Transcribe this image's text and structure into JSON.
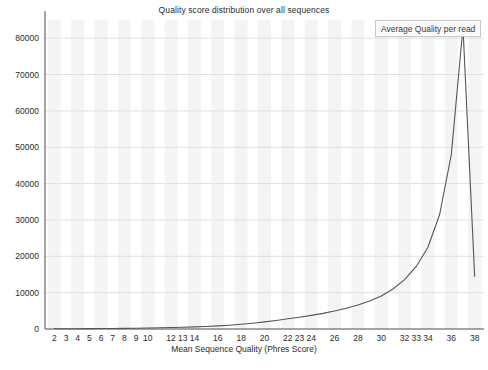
{
  "chart_data": {
    "type": "line",
    "title": "Quality score distribution over all sequences",
    "xlabel": "Mean Sequence Quality (Phres Score)",
    "ylabel": "",
    "xlim": [
      1.2,
      38.8
    ],
    "ylim": [
      0,
      85000
    ],
    "grid": true,
    "legend_position": "top-right",
    "series": [
      {
        "name": "Average Quality per read",
        "color": "#555555",
        "x": [
          2,
          3,
          4,
          5,
          6,
          7,
          8,
          9,
          10,
          11,
          12,
          13,
          14,
          15,
          16,
          17,
          18,
          19,
          20,
          21,
          22,
          23,
          24,
          25,
          26,
          27,
          28,
          29,
          30,
          31,
          32,
          33,
          34,
          35,
          36,
          37,
          38
        ],
        "values": [
          60,
          70,
          85,
          100,
          120,
          150,
          180,
          220,
          270,
          330,
          400,
          480,
          580,
          700,
          850,
          1050,
          1300,
          1600,
          1950,
          2350,
          2800,
          3250,
          3750,
          4300,
          4950,
          5700,
          6600,
          7700,
          9100,
          11000,
          13600,
          17200,
          22500,
          31500,
          48000,
          83000,
          14500
        ]
      }
    ],
    "yticks": [
      0,
      10000,
      20000,
      30000,
      40000,
      50000,
      60000,
      70000,
      80000
    ],
    "ytick_labels": [
      "0",
      "10000",
      "20000",
      "30000",
      "40000",
      "50000",
      "60000",
      "70000",
      "80000"
    ],
    "xticks": [
      2,
      3,
      4,
      5,
      6,
      7,
      8,
      9,
      10,
      12,
      13,
      14,
      16,
      18,
      20,
      22,
      23,
      24,
      26,
      28,
      30,
      32,
      33,
      34,
      36,
      38
    ],
    "xtick_labels": [
      "2",
      "3",
      "4",
      "5",
      "6",
      "7",
      "8",
      "9",
      "10",
      "12",
      "13",
      "14",
      "16",
      "18",
      "20",
      "22",
      "23",
      "24",
      "26",
      "28",
      "30",
      "32",
      "33",
      "34",
      "36",
      "38"
    ],
    "colors": {
      "line": "#555555",
      "axis": "#4d4d4d",
      "gridline": "#e0e0e0",
      "band": "#f4f4f4",
      "background": "#ffffff",
      "text": "#2b2b2b"
    }
  },
  "legend": {
    "label": "Average Quality per read"
  }
}
